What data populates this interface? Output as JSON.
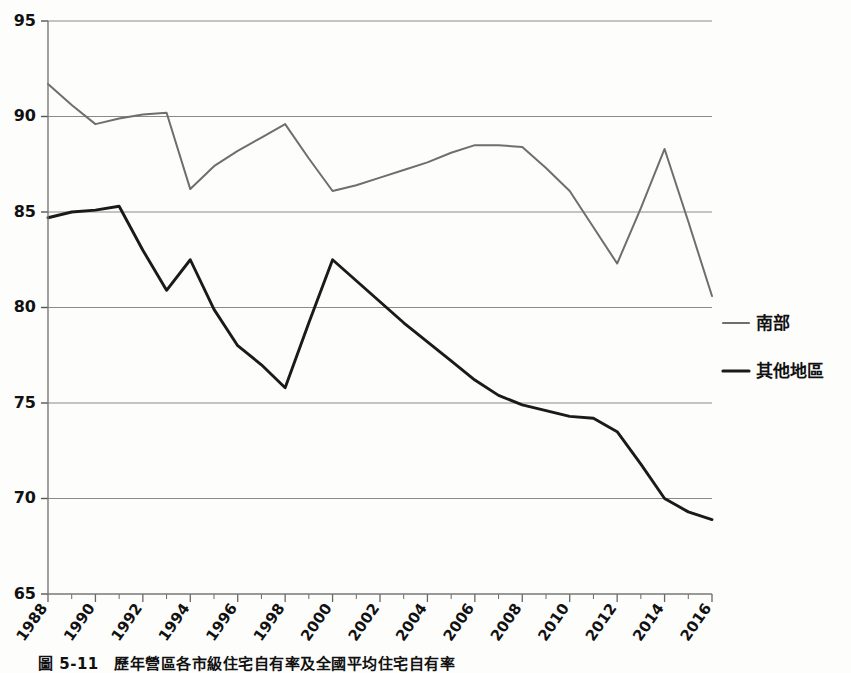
{
  "chart_data": {
    "type": "line",
    "title": "",
    "xlabel": "",
    "ylabel": "",
    "ylim": [
      65,
      95
    ],
    "xlim": [
      1988,
      2016
    ],
    "ytick_step": 5,
    "xtick_step": 2,
    "grid": true,
    "legend_position": "right",
    "yticks": [
      65,
      70,
      75,
      80,
      85,
      90,
      95
    ],
    "xticks": [
      1988,
      1990,
      1992,
      1994,
      1996,
      1998,
      2000,
      2002,
      2004,
      2006,
      2008,
      2010,
      2012,
      2014,
      2016
    ],
    "x": [
      1988,
      1989,
      1990,
      1991,
      1992,
      1993,
      1994,
      1995,
      1996,
      1997,
      1998,
      1999,
      2000,
      2001,
      2002,
      2003,
      2004,
      2005,
      2006,
      2007,
      2008,
      2009,
      2010,
      2011,
      2012,
      2013,
      2014,
      2015,
      2016
    ],
    "series": [
      {
        "name": "南部",
        "color": "#6e6e6e",
        "values": [
          91.7,
          90.6,
          89.6,
          89.9,
          90.1,
          90.2,
          86.2,
          87.4,
          88.2,
          88.9,
          89.6,
          87.8,
          86.1,
          86.4,
          86.8,
          87.2,
          87.6,
          88.1,
          88.5,
          88.5,
          88.4,
          87.3,
          86.1,
          84.2,
          82.3,
          85.2,
          88.3,
          84.5,
          80.6
        ]
      },
      {
        "name": "其他地區",
        "color": "#1a1a1a",
        "values": [
          84.7,
          85.0,
          85.1,
          85.3,
          83.0,
          80.9,
          82.5,
          79.9,
          78.0,
          77.0,
          75.8,
          79.2,
          82.5,
          81.4,
          80.3,
          79.2,
          78.2,
          77.2,
          76.2,
          75.4,
          74.9,
          74.6,
          74.3,
          74.2,
          73.5,
          71.8,
          70.0,
          69.3,
          68.9
        ]
      }
    ]
  },
  "legend": {
    "items": [
      {
        "label": "南部",
        "color": "#6e6e6e"
      },
      {
        "label": "其他地區",
        "color": "#1a1a1a"
      }
    ]
  },
  "caption": {
    "text": "圖 5-11　歷年營區各市級住宅自有率及全國平均住宅自有率"
  },
  "axes": {
    "y_min_label": "65",
    "y_max_label": "95"
  }
}
